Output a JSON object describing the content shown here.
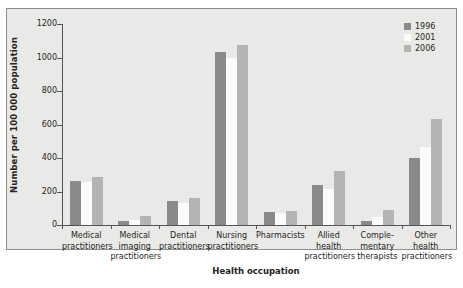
{
  "chart_data": {
    "type": "bar",
    "title": "",
    "xlabel": "Health occupation",
    "ylabel": "Number per 100 000 population",
    "ylim": [
      0,
      1200
    ],
    "yticks": [
      0,
      200,
      400,
      600,
      800,
      1000,
      1200
    ],
    "grid": false,
    "legend_position": "top-right",
    "categories": [
      "Medical practitioners",
      "Medical imaging practitioners",
      "Dental practitioners",
      "Nursing practitioners",
      "Pharmacists",
      "Allied health practitioners",
      "Complementary therapists",
      "Other health practitioners"
    ],
    "category_lines": [
      [
        "Medical",
        "practitioners"
      ],
      [
        "Medical",
        "imaging",
        "practitioners"
      ],
      [
        "Dental",
        "practitioners"
      ],
      [
        "Nursing",
        "practitioners"
      ],
      [
        "Pharmacists"
      ],
      [
        "Allied",
        "health",
        "practitioners"
      ],
      [
        "Comple-",
        "mentary",
        "therapists"
      ],
      [
        "Other",
        "health",
        "practitioners"
      ]
    ],
    "series": [
      {
        "name": "1996",
        "color": "#8a8a8a",
        "values": [
          265,
          25,
          145,
          1030,
          75,
          240,
          25,
          400
        ]
      },
      {
        "name": "2001",
        "color": "#fbfbf9",
        "values": [
          255,
          30,
          130,
          1000,
          70,
          215,
          45,
          465
        ]
      },
      {
        "name": "2006",
        "color": "#b4b4b2",
        "values": [
          285,
          55,
          160,
          1075,
          85,
          325,
          90,
          630
        ]
      }
    ]
  },
  "legend": {
    "items": [
      {
        "label": "1996"
      },
      {
        "label": "2001"
      },
      {
        "label": "2006"
      }
    ]
  }
}
